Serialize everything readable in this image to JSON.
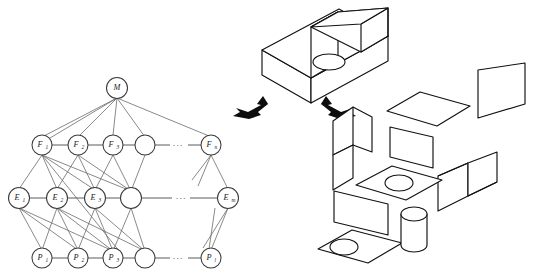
{
  "figure": {
    "background_color": "#ffffff",
    "line_color": "#111111",
    "edge_color": "#6b6b6b",
    "arrow_color": "#0d0d0d"
  },
  "graph": {
    "name": "hierarchy-graph",
    "root": {
      "id": "M",
      "label": "M",
      "base": "M",
      "sub": "",
      "cx": 117,
      "cy": 88,
      "r": 10.5
    },
    "ellipsis_glyph": "···",
    "layers": [
      {
        "name": "feature-layer",
        "key": "F",
        "cy": 145,
        "ellipsis_x": 178,
        "nodes": [
          {
            "id": "F1",
            "base": "F",
            "sub": "1",
            "cx": 42,
            "cy": 145,
            "r": 10.0,
            "labeled": true
          },
          {
            "id": "F2",
            "base": "F",
            "sub": "2",
            "cx": 78,
            "cy": 145,
            "r": 10.0,
            "labeled": true
          },
          {
            "id": "F3",
            "base": "F",
            "sub": "3",
            "cx": 113,
            "cy": 145,
            "r": 10.0,
            "labeled": true
          },
          {
            "id": "F4",
            "base": "",
            "sub": "",
            "cx": 145,
            "cy": 145,
            "r": 10.0,
            "labeled": false
          },
          {
            "id": "Fn",
            "base": "F",
            "sub": "n",
            "cx": 211,
            "cy": 145,
            "r": 10.0,
            "labeled": true
          }
        ]
      },
      {
        "name": "element-layer",
        "key": "E",
        "cy": 198,
        "ellipsis_x": 181,
        "nodes": [
          {
            "id": "E1",
            "base": "E",
            "sub": "1",
            "cx": 19,
            "cy": 198,
            "r": 10.5,
            "labeled": true
          },
          {
            "id": "E2",
            "base": "E",
            "sub": "2",
            "cx": 57,
            "cy": 198,
            "r": 10.5,
            "labeled": true
          },
          {
            "id": "E3",
            "base": "E",
            "sub": "3",
            "cx": 95,
            "cy": 198,
            "r": 10.5,
            "labeled": true
          },
          {
            "id": "E4",
            "base": "",
            "sub": "",
            "cx": 131,
            "cy": 198,
            "r": 10.5,
            "labeled": false
          },
          {
            "id": "Em",
            "base": "E",
            "sub": "m",
            "cx": 228,
            "cy": 198,
            "r": 10.5,
            "labeled": true
          }
        ]
      },
      {
        "name": "primitive-layer",
        "key": "P",
        "cy": 258,
        "ellipsis_x": 178,
        "nodes": [
          {
            "id": "P1",
            "base": "P",
            "sub": "1",
            "cx": 42,
            "cy": 258,
            "r": 10.0,
            "labeled": true
          },
          {
            "id": "P2",
            "base": "P",
            "sub": "2",
            "cx": 78,
            "cy": 258,
            "r": 10.0,
            "labeled": true
          },
          {
            "id": "P3",
            "base": "P",
            "sub": "3",
            "cx": 113,
            "cy": 258,
            "r": 10.0,
            "labeled": true
          },
          {
            "id": "P4",
            "base": "",
            "sub": "",
            "cx": 145,
            "cy": 258,
            "r": 10.0,
            "labeled": false
          },
          {
            "id": "Pl",
            "base": "P",
            "sub": "l",
            "cx": 211,
            "cy": 258,
            "r": 10.0,
            "labeled": true
          }
        ]
      }
    ]
  },
  "solid": {
    "name": "isometric-l-block",
    "description": "L-shaped isometric block with circular through-hole on the lower step",
    "hole": {
      "cx": 329,
      "cy": 62,
      "rx": 16,
      "ry": 8
    }
  },
  "arrows": [
    {
      "name": "explode-arrow-left",
      "direction": "down-left",
      "x": 249,
      "y": 108
    },
    {
      "name": "explode-arrow-right",
      "direction": "down-right",
      "x": 340,
      "y": 108
    }
  ],
  "exploded": {
    "name": "exploded-face-view",
    "parts": [
      {
        "name": "face-top-right-plate",
        "shape": "parallelogram"
      },
      {
        "name": "face-top-deck",
        "shape": "parallelogram"
      },
      {
        "name": "face-front-panel",
        "shape": "parallelogram"
      },
      {
        "name": "face-left-bent-panel",
        "shape": "l-bent"
      },
      {
        "name": "face-right-bent-panel",
        "shape": "l-bent"
      },
      {
        "name": "face-base-plate-hole",
        "shape": "parallelogram-with-hole"
      },
      {
        "name": "face-bottom-plate-hole",
        "shape": "parallelogram-with-hole"
      },
      {
        "name": "cylinder-pin",
        "shape": "cylinder"
      }
    ]
  }
}
